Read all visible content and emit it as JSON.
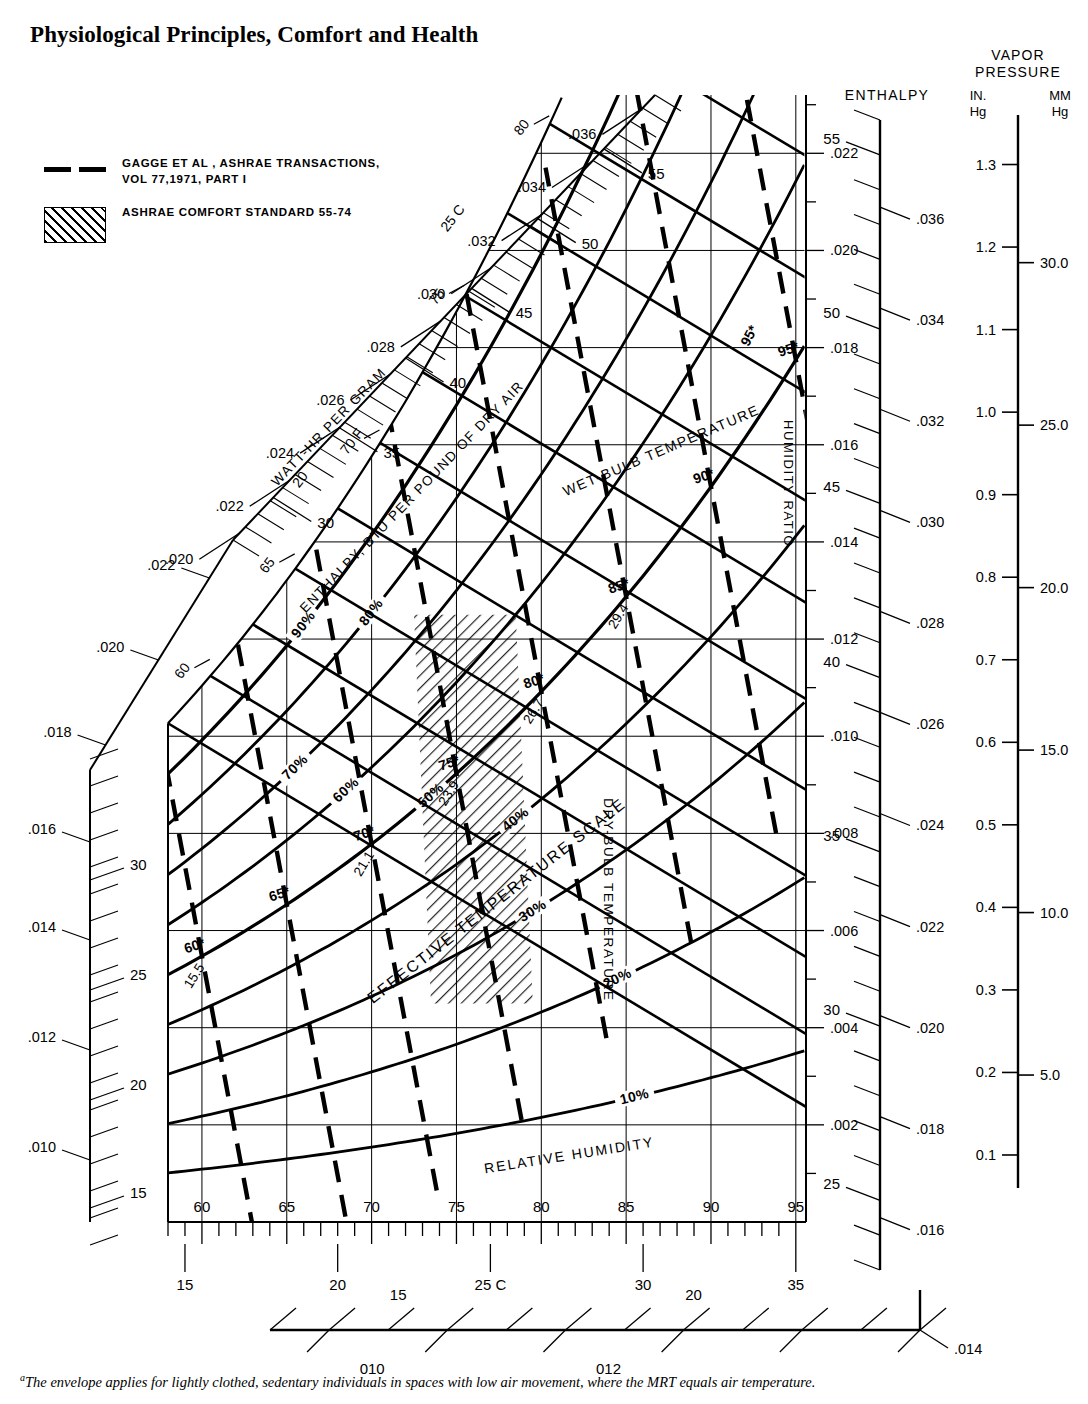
{
  "title": "Physiological Principles, Comfort and Health",
  "caption": "The envelope applies for lightly clothed, sedentary individuals in spaces with low air movement, where the MRT equals air temperature.",
  "caption_marker": "a",
  "legend": {
    "items": [
      {
        "marker": "dashed-line",
        "label": "GAGGE ET AL , ASHRAE TRANSACTIONS,\nVOL 77,1971, PART I"
      },
      {
        "marker": "hatch-swatch",
        "label": "ASHRAE COMFORT STANDARD 55-74"
      }
    ]
  },
  "axis_labels": {
    "humidity_ratio": "HUMIDITY RATIO",
    "dry_bulb": "DRY-BULB TEMPERATURE",
    "wet_bulb": "WET-BULB TEMPERATURE",
    "relative_humidity": "RELATIVE HUMIDITY",
    "effective_temperature": "EFFECTIVE TEMPERATURE SCALE",
    "enthalpy_btu": "ENTHALPY, BTU PER POUND OF DRY AIR",
    "watt_hr": "WATT-HR PER GRAM",
    "enthalpy_scale": "ENTHALPY",
    "vapor_pressure": "VAPOR PRESSURE",
    "vp_in": "IN.\nHg",
    "vp_mm": "MM\nHg"
  },
  "chart_data": {
    "type": "line",
    "xlabel": "DRY-BULB TEMPERATURE",
    "ylabel": "HUMIDITY RATIO",
    "xlim_f": [
      58,
      95
    ],
    "ylim_w": [
      0.0,
      0.0228
    ],
    "grid": true,
    "dry_bulb_f_ticks": [
      60,
      65,
      70,
      75,
      80,
      85,
      90,
      95
    ],
    "dry_bulb_c_ticks": [
      15,
      20,
      25,
      30,
      35
    ],
    "dry_bulb_c_tick_labels": [
      "15",
      "20",
      "25 C",
      "30",
      "35"
    ],
    "humidity_ratio_ticks": [
      0.002,
      0.004,
      0.006,
      0.008,
      0.01,
      0.012,
      0.014,
      0.016,
      0.018,
      0.02,
      0.022
    ],
    "humidity_ratio_tick_labels": [
      ".002",
      ".004",
      ".006",
      ".008",
      ".010",
      ".012",
      ".014",
      ".016",
      ".018",
      ".020",
      ".022"
    ],
    "relative_humidity_curves": [
      {
        "label": "10%",
        "value": 10
      },
      {
        "label": "20%",
        "value": 20
      },
      {
        "label": "30%",
        "value": 30
      },
      {
        "label": "40%",
        "value": 40
      },
      {
        "label": "50%",
        "value": 50
      },
      {
        "label": "60%",
        "value": 60
      },
      {
        "label": "70%",
        "value": 70
      },
      {
        "label": "80%",
        "value": 80
      },
      {
        "label": "90%",
        "value": 90
      }
    ],
    "wet_bulb_labels_f": [
      "60",
      "65",
      "70 F",
      "75",
      "80",
      "85"
    ],
    "wet_bulb_labels_c": [
      "20",
      "25 C",
      "30"
    ],
    "effective_temperature_f": [
      "60*",
      "65*",
      "70*",
      "75*",
      "80*",
      "85*",
      "90*",
      "95*"
    ],
    "effective_temperature_c": [
      "15.5",
      "21.1",
      "23.9",
      "26.7",
      "29.4"
    ],
    "saturation_enthalpy_btu": [
      35,
      40,
      45,
      50,
      55
    ],
    "saturation_humidity_ratio": [
      ".024",
      ".026",
      ".028",
      ".030",
      ".032",
      ".034",
      ".036"
    ],
    "left_enthalpy_btu": [
      15,
      20,
      25,
      30
    ],
    "left_humidity_ratio": [
      ".010",
      ".012",
      ".014",
      ".016",
      ".018",
      ".020",
      ".022"
    ],
    "right_enthalpy_ticks": [
      25,
      30,
      35,
      40,
      45,
      50,
      55
    ],
    "right_humidity_ratio_ticks": [
      ".016",
      ".018",
      ".020",
      ".022",
      ".024",
      ".026",
      ".028",
      ".030",
      ".032",
      ".034",
      ".036"
    ],
    "vapor_pressure_in_hg": [
      "0.1",
      "0.2",
      "0.3",
      "0.4",
      "0.5",
      "0.6",
      "0.7",
      "0.8",
      "0.9",
      "1.0",
      "1.1",
      "1.2",
      "1.3"
    ],
    "vapor_pressure_mm_hg": [
      "5.0",
      "10.0",
      "15.0",
      "20.0",
      "25.0",
      "30.0"
    ],
    "bottom_scale_upper": [
      "15",
      "20"
    ],
    "bottom_scale_lower": [
      "010",
      "012",
      ".014"
    ],
    "comfort_envelope": {
      "name": "ASHRAE COMFORT STANDARD 55-74",
      "fill": "hatch-45",
      "et_range_f": [
        72,
        78
      ],
      "approx_vertices_f_w": [
        [
          72.5,
          0.0125
        ],
        [
          78.5,
          0.0125
        ],
        [
          79.5,
          0.0045
        ],
        [
          73.5,
          0.0045
        ]
      ]
    }
  },
  "colors": {
    "ink": "#000000",
    "paper": "#ffffff"
  }
}
